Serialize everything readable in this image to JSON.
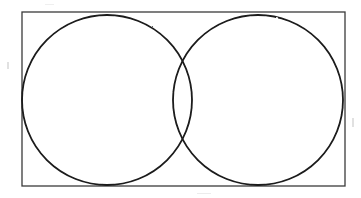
{
  "figure": {
    "background_color": "#ffffff",
    "stroke_color": "#1a1a1a",
    "rect_stroke_color": "#3a3a3a",
    "canvas": {
      "width": 361,
      "height": 198
    }
  },
  "shapes": {
    "rectangle": {
      "label": "bounding-rectangle",
      "x": 22,
      "y": 12,
      "width": 323,
      "height": 174,
      "stroke_width": 1.3,
      "fill": "none"
    },
    "circles": [
      {
        "label": "left-circle",
        "cx": 107,
        "cy": 100,
        "r": 85,
        "stroke_width": 1.8,
        "fill": "none"
      },
      {
        "label": "right-circle",
        "cx": 258,
        "cy": 100,
        "r": 85,
        "stroke_width": 1.8,
        "fill": "none"
      }
    ],
    "intersections": [
      {
        "label": "upper-intersection",
        "x": 180,
        "y": 53
      },
      {
        "label": "lower-intersection",
        "x": 180,
        "y": 145
      }
    ]
  }
}
